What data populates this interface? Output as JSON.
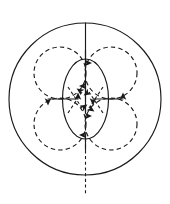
{
  "figure": {
    "background_color": "#ffffff",
    "stroke_color": "#1a1a1a",
    "width": 170,
    "height": 204
  },
  "diagram_data": {
    "type": "geometric-line-diagram",
    "canvas": {
      "width": 170,
      "height": 204
    },
    "outer_circle": {
      "name": "outer-boundary-circle",
      "style": "solid",
      "cx": 85,
      "cy": 99,
      "r": 76
    },
    "dashed_circles": [
      {
        "name": "dashed-circle-top-left",
        "style": "dashed",
        "cx": 60,
        "cy": 73,
        "r": 26
      },
      {
        "name": "dashed-circle-top-right",
        "style": "dashed",
        "cx": 111,
        "cy": 73,
        "r": 26
      },
      {
        "name": "dashed-circle-bottom-left",
        "style": "dashed",
        "cx": 60,
        "cy": 124,
        "r": 26
      },
      {
        "name": "dashed-circle-bottom-right",
        "style": "dashed",
        "cx": 111,
        "cy": 124,
        "r": 26
      }
    ],
    "center_ellipse": {
      "name": "center-ellipse",
      "style": "solid",
      "cx": 85.5,
      "cy": 99,
      "rx": 23,
      "ry": 40
    },
    "vertical_axis": {
      "name": "vertical-axis-line",
      "solid_segment": {
        "x": 85.5,
        "y1": 23,
        "y2": 99
      },
      "dashed_segment": {
        "x": 85.5,
        "y1": 99,
        "y2": 196
      }
    },
    "axis_arrows": [
      {
        "name": "arrow-up-at-center",
        "direction": "up",
        "x": 85.5,
        "tip_y": 86,
        "tail_y": 112
      },
      {
        "name": "arrow-down-at-top",
        "direction": "down",
        "x": 85.5,
        "tip_y": 63,
        "tail_y": 50
      },
      {
        "name": "arrow-up-at-bottom",
        "direction": "up",
        "x": 85.5,
        "tip_y": 135,
        "tail_y": 150
      },
      {
        "name": "arrow-down-at-mid",
        "direction": "down",
        "x": 85.5,
        "tip_y": 116,
        "tail_y": 104
      }
    ],
    "horizontal_arrows": [
      {
        "name": "arrow-left-double-head",
        "y": 99,
        "x1": 48,
        "x2": 78
      },
      {
        "name": "arrow-right-double-head",
        "y": 99,
        "x1": 93,
        "x2": 123
      }
    ],
    "diagonal_dashed_arrows": [
      {
        "name": "diagonal-arrow-upper-left",
        "from": [
          68,
          113
        ],
        "to": [
          82,
          92
        ]
      },
      {
        "name": "diagonal-arrow-upper-right",
        "from": [
          103,
          113
        ],
        "to": [
          89,
          92
        ]
      },
      {
        "name": "diagonal-arrow-lower-left",
        "from": [
          68,
          87
        ],
        "to": [
          82,
          108
        ]
      },
      {
        "name": "diagonal-arrow-lower-right",
        "from": [
          103,
          87
        ],
        "to": [
          89,
          108
        ]
      }
    ],
    "legend": [],
    "labels": []
  }
}
